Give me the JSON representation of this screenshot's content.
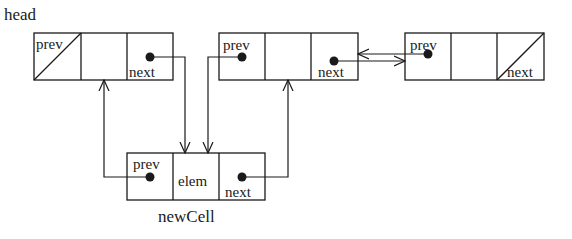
{
  "diagram": {
    "type": "doubly-linked-list-insertion",
    "labels": {
      "head": "head",
      "new_cell": "newCell"
    },
    "cells": [
      {
        "id": "cell-1",
        "fields": {
          "prev": "prev",
          "elem": "",
          "next": "next"
        },
        "prev_null": true,
        "next_null": false
      },
      {
        "id": "cell-2",
        "fields": {
          "prev": "prev",
          "elem": "",
          "next": "next"
        },
        "prev_null": false,
        "next_null": false
      },
      {
        "id": "cell-3",
        "fields": {
          "prev": "prev",
          "elem": "",
          "next": "next"
        },
        "prev_null": false,
        "next_null": true
      },
      {
        "id": "new-cell",
        "fields": {
          "prev": "prev",
          "elem": "elem",
          "next": "next"
        },
        "prev_null": false,
        "next_null": false
      }
    ],
    "edges": [
      {
        "from": "cell-1.next",
        "to": "new-cell"
      },
      {
        "from": "cell-2.prev",
        "to": "new-cell"
      },
      {
        "from": "new-cell.prev",
        "to": "cell-1"
      },
      {
        "from": "new-cell.next",
        "to": "cell-2"
      },
      {
        "from": "cell-2.next",
        "to": "cell-3"
      },
      {
        "from": "cell-3.prev",
        "to": "cell-2"
      }
    ],
    "colors": {
      "stroke": "#1a1a1a",
      "background": "#ffffff"
    }
  }
}
